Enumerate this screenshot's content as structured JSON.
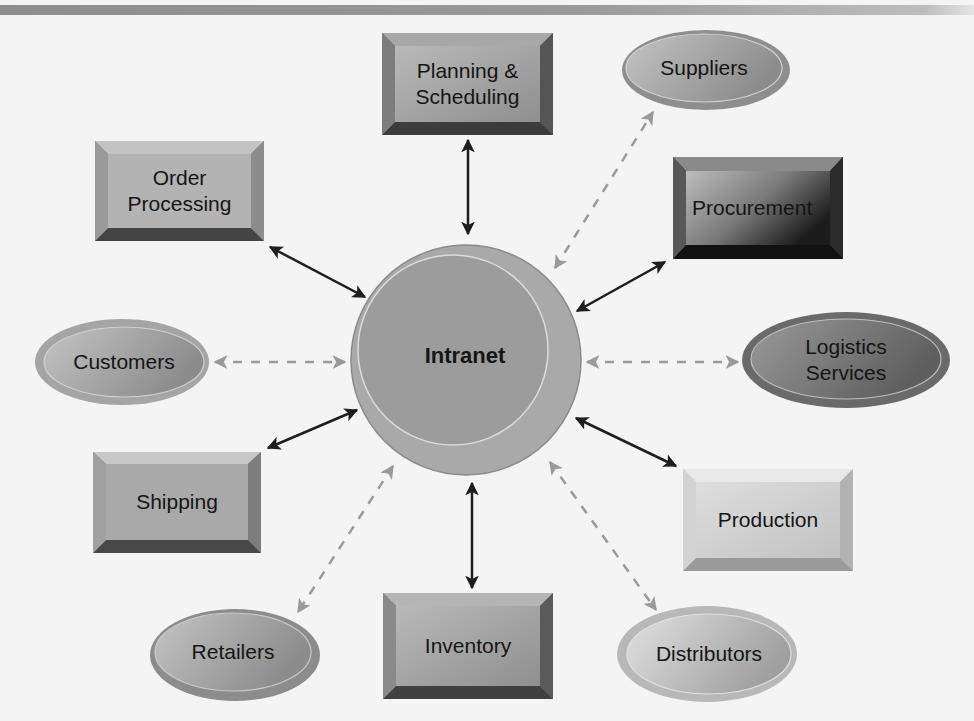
{
  "diagram": {
    "hub": {
      "id": "intranet",
      "label": "Intranet"
    },
    "internal_nodes": [
      {
        "id": "planning",
        "label": "Planning &\nScheduling",
        "shape": "beveled-box"
      },
      {
        "id": "order-processing",
        "label": "Order\nProcessing",
        "shape": "beveled-box"
      },
      {
        "id": "procurement",
        "label": "Procurement",
        "shape": "beveled-box"
      },
      {
        "id": "shipping",
        "label": "Shipping",
        "shape": "beveled-box"
      },
      {
        "id": "production",
        "label": "Production",
        "shape": "beveled-box"
      },
      {
        "id": "inventory",
        "label": "Inventory",
        "shape": "beveled-box"
      }
    ],
    "external_nodes": [
      {
        "id": "suppliers",
        "label": "Suppliers",
        "shape": "ellipse"
      },
      {
        "id": "customers",
        "label": "Customers",
        "shape": "ellipse"
      },
      {
        "id": "logistics",
        "label": "Logistics\nServices",
        "shape": "ellipse"
      },
      {
        "id": "retailers",
        "label": "Retailers",
        "shape": "ellipse"
      },
      {
        "id": "distributors",
        "label": "Distributors",
        "shape": "ellipse"
      }
    ],
    "connections": [
      {
        "from": "intranet",
        "to": "planning",
        "style": "solid",
        "direction": "bidirectional"
      },
      {
        "from": "intranet",
        "to": "order-processing",
        "style": "solid",
        "direction": "bidirectional"
      },
      {
        "from": "intranet",
        "to": "procurement",
        "style": "solid",
        "direction": "bidirectional"
      },
      {
        "from": "intranet",
        "to": "shipping",
        "style": "solid",
        "direction": "bidirectional"
      },
      {
        "from": "intranet",
        "to": "production",
        "style": "solid",
        "direction": "bidirectional"
      },
      {
        "from": "intranet",
        "to": "inventory",
        "style": "solid",
        "direction": "bidirectional"
      },
      {
        "from": "intranet",
        "to": "suppliers",
        "style": "dashed",
        "direction": "bidirectional"
      },
      {
        "from": "intranet",
        "to": "customers",
        "style": "dashed",
        "direction": "bidirectional"
      },
      {
        "from": "intranet",
        "to": "logistics",
        "style": "dashed",
        "direction": "bidirectional"
      },
      {
        "from": "intranet",
        "to": "retailers",
        "style": "dashed",
        "direction": "bidirectional"
      },
      {
        "from": "intranet",
        "to": "distributors",
        "style": "dashed",
        "direction": "bidirectional"
      }
    ]
  },
  "labels": {
    "intranet": "Intranet",
    "planning": "Planning &\nScheduling",
    "order_processing": "Order\nProcessing",
    "procurement": "Procurement",
    "shipping": "Shipping",
    "production": "Production",
    "inventory": "Inventory",
    "suppliers": "Suppliers",
    "customers": "Customers",
    "logistics": "Logistics\nServices",
    "retailers": "Retailers",
    "distributors": "Distributors"
  },
  "colors": {
    "solid_arrow": "#1e1e1e",
    "dashed_arrow": "#9a9a9a",
    "hub_outer": "#a9a9a9",
    "hub_inner": "#9c9c9c"
  }
}
